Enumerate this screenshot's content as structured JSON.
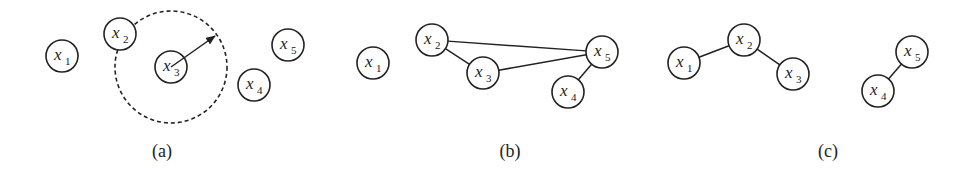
{
  "figure": {
    "panels": [
      {
        "id": "a",
        "caption": "(a)",
        "caption_pos": [
          162,
          157
        ],
        "nodes": [
          {
            "id": "x1",
            "var": "x",
            "sub": "1",
            "cx": 62,
            "cy": 56
          },
          {
            "id": "x2",
            "var": "x",
            "sub": "2",
            "cx": 120,
            "cy": 34
          },
          {
            "id": "x3",
            "var": "x",
            "sub": "3",
            "cx": 171,
            "cy": 67
          },
          {
            "id": "x4",
            "var": "x",
            "sub": "4",
            "cx": 254,
            "cy": 85
          },
          {
            "id": "x5",
            "var": "x",
            "sub": "5",
            "cx": 288,
            "cy": 45
          }
        ],
        "edges": [],
        "neighborhood": {
          "center": "x3",
          "cx": 171,
          "cy": 67,
          "r": 56,
          "style": "dashed"
        },
        "radius_arrow": {
          "from": [
            171,
            67
          ],
          "to": [
            215,
            36
          ]
        }
      },
      {
        "id": "b",
        "caption": "(b)",
        "caption_pos": [
          510,
          157
        ],
        "nodes": [
          {
            "id": "x1",
            "var": "x",
            "sub": "1",
            "cx": 373,
            "cy": 63
          },
          {
            "id": "x2",
            "var": "x",
            "sub": "2",
            "cx": 432,
            "cy": 40
          },
          {
            "id": "x3",
            "var": "x",
            "sub": "3",
            "cx": 483,
            "cy": 73
          },
          {
            "id": "x4",
            "var": "x",
            "sub": "4",
            "cx": 568,
            "cy": 92
          },
          {
            "id": "x5",
            "var": "x",
            "sub": "5",
            "cx": 602,
            "cy": 52
          }
        ],
        "edges": [
          [
            "x2",
            "x3"
          ],
          [
            "x2",
            "x5"
          ],
          [
            "x3",
            "x5"
          ],
          [
            "x5",
            "x4"
          ]
        ]
      },
      {
        "id": "c",
        "caption": "(c)",
        "caption_pos": [
          828,
          157
        ],
        "nodes": [
          {
            "id": "x1",
            "var": "x",
            "sub": "1",
            "cx": 684,
            "cy": 63
          },
          {
            "id": "x2",
            "var": "x",
            "sub": "2",
            "cx": 744,
            "cy": 40
          },
          {
            "id": "x3",
            "var": "x",
            "sub": "3",
            "cx": 793,
            "cy": 74
          },
          {
            "id": "x4",
            "var": "x",
            "sub": "4",
            "cx": 878,
            "cy": 91
          },
          {
            "id": "x5",
            "var": "x",
            "sub": "5",
            "cx": 912,
            "cy": 52
          }
        ],
        "edges": [
          [
            "x1",
            "x2"
          ],
          [
            "x2",
            "x3"
          ],
          [
            "x5",
            "x4"
          ]
        ]
      }
    ],
    "node_radius": 16,
    "colors": {
      "stroke": "#222222",
      "background": "#ffffff"
    }
  }
}
